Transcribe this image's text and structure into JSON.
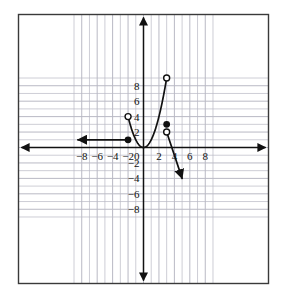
{
  "figure": {
    "kind": "coordinate-grid-graph",
    "background_color": "#ffffff",
    "frame_color": "#3a3a3a",
    "grid_color": "#b9b9c4",
    "axis_color": "#111111",
    "curve_color": "#111111"
  },
  "chart_data": {
    "type": "line",
    "title": "",
    "xlabel": "",
    "ylabel": "",
    "xlim": [
      -9.5,
      9.5
    ],
    "ylim": [
      -9.5,
      9.5
    ],
    "grid": true,
    "legend": "none",
    "x_ticks": [
      -8,
      -6,
      -4,
      -2,
      0,
      2,
      4,
      6,
      8
    ],
    "y_ticks": [
      8,
      6,
      4,
      2,
      0,
      -2,
      -4,
      -6,
      -8
    ],
    "x_tick_labels": [
      "−8",
      "−6",
      "−4",
      "−2",
      "0",
      "2",
      "4",
      "6",
      "8"
    ],
    "y_tick_labels": [
      "8",
      "6",
      "4",
      "2",
      "0",
      "−2",
      "−4",
      "−6",
      "−8"
    ],
    "axis_arrows": [
      "left",
      "right",
      "up",
      "down"
    ],
    "series": [
      {
        "name": "constant-ray",
        "type": "ray",
        "shape": "horizontal",
        "value": 1,
        "from": [
          -2,
          1
        ],
        "to": [
          -8.5,
          1
        ],
        "direction": "left",
        "arrow_at_end": true,
        "endpoint_marker": "closed",
        "endpoint": [
          -2,
          1
        ]
      },
      {
        "name": "parabola-segment",
        "type": "curve",
        "equation": "y = x^2",
        "domain": [
          -2,
          3
        ],
        "points": [
          [
            -2,
            4
          ],
          [
            -1.5,
            2.25
          ],
          [
            -1,
            1
          ],
          [
            -0.5,
            0.25
          ],
          [
            0,
            0
          ],
          [
            0.5,
            0.25
          ],
          [
            1,
            1
          ],
          [
            1.5,
            2.25
          ],
          [
            2,
            4
          ],
          [
            2.5,
            6.25
          ],
          [
            3,
            9
          ]
        ],
        "left_endpoint_marker": "open",
        "left_endpoint": [
          -2,
          4
        ],
        "right_endpoint_marker": "open",
        "right_endpoint": [
          3,
          9
        ],
        "vertex": [
          0,
          0
        ]
      },
      {
        "name": "isolated-point",
        "type": "point",
        "marker": "closed",
        "at": [
          3,
          3
        ]
      },
      {
        "name": "descending-ray",
        "type": "ray",
        "from": [
          3,
          2
        ],
        "to": [
          5,
          -4
        ],
        "slope": -3,
        "direction": "down-right",
        "arrow_at_end": true,
        "endpoint_marker": "open",
        "endpoint": [
          3,
          2
        ]
      }
    ],
    "markers": [
      {
        "at": [
          -2,
          1
        ],
        "style": "closed",
        "belongs_to": "constant-ray"
      },
      {
        "at": [
          -2,
          4
        ],
        "style": "open",
        "belongs_to": "parabola-segment"
      },
      {
        "at": [
          3,
          9
        ],
        "style": "open",
        "belongs_to": "parabola-segment"
      },
      {
        "at": [
          3,
          3
        ],
        "style": "closed",
        "belongs_to": "isolated-point"
      },
      {
        "at": [
          3,
          2
        ],
        "style": "open",
        "belongs_to": "descending-ray"
      }
    ]
  }
}
